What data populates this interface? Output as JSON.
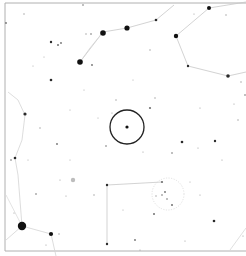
{
  "chart": {
    "type": "star-finder-chart",
    "width": 246,
    "height": 256,
    "background": "#ffffff",
    "frame": {
      "x": 5,
      "y": 3,
      "right": 250,
      "bottom": 251,
      "color": "#b0b0b0"
    },
    "target_circle": {
      "cx": 127,
      "cy": 127,
      "r": 17,
      "color": "#222222",
      "stroke_width": 1.3
    },
    "target_star": {
      "x": 127,
      "y": 127,
      "r": 1.6
    },
    "cluster": {
      "cx": 168,
      "cy": 194,
      "r": 16,
      "color": "#cfcfcf"
    },
    "galaxy": {
      "x": 73,
      "y": 180,
      "r": 2.2,
      "color": "#bdbdbd"
    },
    "constellation_lines": [
      {
        "points": [
          [
            80,
            62
          ],
          [
            103,
            32
          ],
          [
            127,
            28
          ],
          [
            156,
            20
          ],
          [
            174,
            5
          ]
        ],
        "color": "#c8c8c8"
      },
      {
        "points": [
          [
            103,
            32
          ],
          [
            90,
            48
          ],
          [
            80,
            62
          ]
        ],
        "color": "#d6d6d6"
      },
      {
        "points": [
          [
            176,
            36
          ],
          [
            209,
            8
          ],
          [
            246,
            2
          ]
        ],
        "color": "#c8c8c8"
      },
      {
        "points": [
          [
            176,
            36
          ],
          [
            188,
            66
          ],
          [
            228,
            76
          ],
          [
            246,
            72
          ]
        ],
        "color": "#c8c8c8"
      },
      {
        "points": [
          [
            22,
            226
          ],
          [
            18,
            175
          ],
          [
            15,
            158
          ],
          [
            22,
            140
          ],
          [
            25,
            115
          ],
          [
            18,
            100
          ],
          [
            8,
            92
          ]
        ],
        "color": "#d4d4d4"
      },
      {
        "points": [
          [
            22,
            226
          ],
          [
            51,
            234
          ],
          [
            56,
            256
          ]
        ],
        "color": "#d4d4d4"
      },
      {
        "points": [
          [
            22,
            226
          ],
          [
            6,
            240
          ]
        ],
        "color": "#d4d4d4"
      },
      {
        "points": [
          [
            22,
            226
          ],
          [
            6,
            195
          ]
        ],
        "color": "#dcdcdc"
      },
      {
        "points": [
          [
            107,
            244
          ],
          [
            107,
            185
          ],
          [
            162,
            182
          ]
        ],
        "color": "#c8c8c8"
      },
      {
        "points": [
          [
            246,
            228
          ],
          [
            230,
            250
          ]
        ],
        "color": "#d8d8d8"
      }
    ],
    "stars": [
      {
        "x": 22,
        "y": 226,
        "r": 4.2
      },
      {
        "x": 80,
        "y": 62,
        "r": 2.8
      },
      {
        "x": 103,
        "y": 33,
        "r": 2.8
      },
      {
        "x": 127,
        "y": 28,
        "r": 2.6
      },
      {
        "x": 176,
        "y": 36,
        "r": 2.2
      },
      {
        "x": 209,
        "y": 8,
        "r": 2.0
      },
      {
        "x": 228,
        "y": 76,
        "r": 1.8
      },
      {
        "x": 51,
        "y": 234,
        "r": 2.1
      },
      {
        "x": 25,
        "y": 114,
        "r": 1.6
      },
      {
        "x": 15,
        "y": 158,
        "r": 1.3
      },
      {
        "x": 51,
        "y": 80,
        "r": 1.3
      },
      {
        "x": 51,
        "y": 42,
        "r": 1.2
      },
      {
        "x": 58,
        "y": 45,
        "r": 1.0
      },
      {
        "x": 61,
        "y": 43,
        "r": 0.9
      },
      {
        "x": 156,
        "y": 20,
        "r": 1.3
      },
      {
        "x": 188,
        "y": 66,
        "r": 1.2
      },
      {
        "x": 107,
        "y": 185,
        "r": 1.2
      },
      {
        "x": 107,
        "y": 244,
        "r": 1.2
      },
      {
        "x": 162,
        "y": 182,
        "r": 1.1
      },
      {
        "x": 182,
        "y": 142,
        "r": 1.3
      },
      {
        "x": 215,
        "y": 141,
        "r": 1.2
      },
      {
        "x": 214,
        "y": 221,
        "r": 1.3
      },
      {
        "x": 150,
        "y": 108,
        "r": 1.1
      },
      {
        "x": 172,
        "y": 205,
        "r": 1.0
      },
      {
        "x": 154,
        "y": 214,
        "r": 1.0
      },
      {
        "x": 92,
        "y": 65,
        "r": 0.9
      },
      {
        "x": 57,
        "y": 144,
        "r": 0.9
      },
      {
        "x": 106,
        "y": 146,
        "r": 0.8
      },
      {
        "x": 172,
        "y": 153,
        "r": 0.8
      },
      {
        "x": 135,
        "y": 240,
        "r": 0.9
      },
      {
        "x": 165,
        "y": 192,
        "r": 0.9
      },
      {
        "x": 167,
        "y": 199,
        "r": 0.8
      },
      {
        "x": 162,
        "y": 195,
        "r": 0.8
      },
      {
        "x": 156,
        "y": 196,
        "r": 0.7
      },
      {
        "x": 6,
        "y": 23,
        "r": 0.9
      },
      {
        "x": 11,
        "y": 160,
        "r": 0.8
      },
      {
        "x": 59,
        "y": 234,
        "r": 0.7
      },
      {
        "x": 36,
        "y": 194,
        "r": 0.8
      },
      {
        "x": 83,
        "y": 5,
        "r": 0.8
      },
      {
        "x": 91,
        "y": 34,
        "r": 0.8
      },
      {
        "x": 86,
        "y": 34,
        "r": 0.7
      },
      {
        "x": 24,
        "y": 14,
        "r": 0.7
      },
      {
        "x": 40,
        "y": 128,
        "r": 0.7
      },
      {
        "x": 94,
        "y": 195,
        "r": 0.7
      },
      {
        "x": 155,
        "y": 98,
        "r": 0.7
      },
      {
        "x": 150,
        "y": 50,
        "r": 0.7
      },
      {
        "x": 226,
        "y": 15,
        "r": 0.7
      },
      {
        "x": 194,
        "y": 14,
        "r": 0.6
      },
      {
        "x": 245,
        "y": 95,
        "r": 0.8
      },
      {
        "x": 241,
        "y": 82,
        "r": 0.7
      },
      {
        "x": 238,
        "y": 120,
        "r": 0.7
      },
      {
        "x": 234,
        "y": 104,
        "r": 0.6
      },
      {
        "x": 200,
        "y": 108,
        "r": 0.6
      },
      {
        "x": 116,
        "y": 100,
        "r": 0.7
      },
      {
        "x": 112,
        "y": 113,
        "r": 0.6
      },
      {
        "x": 46,
        "y": 245,
        "r": 0.6
      },
      {
        "x": 14,
        "y": 213,
        "r": 0.6
      },
      {
        "x": 143,
        "y": 152,
        "r": 0.6
      },
      {
        "x": 198,
        "y": 148,
        "r": 0.6
      },
      {
        "x": 222,
        "y": 160,
        "r": 0.6
      },
      {
        "x": 185,
        "y": 241,
        "r": 0.6
      },
      {
        "x": 200,
        "y": 195,
        "r": 0.6
      },
      {
        "x": 60,
        "y": 180,
        "r": 0.6
      },
      {
        "x": 66,
        "y": 196,
        "r": 0.6
      },
      {
        "x": 28,
        "y": 160,
        "r": 0.5
      },
      {
        "x": 70,
        "y": 110,
        "r": 0.5
      },
      {
        "x": 44,
        "y": 57,
        "r": 0.5
      },
      {
        "x": 140,
        "y": 250,
        "r": 0.6
      },
      {
        "x": 190,
        "y": 182,
        "r": 0.5
      },
      {
        "x": 243,
        "y": 236,
        "r": 0.6
      },
      {
        "x": 33,
        "y": 66,
        "r": 0.5
      },
      {
        "x": 70,
        "y": 160,
        "r": 0.5
      },
      {
        "x": 84,
        "y": 90,
        "r": 0.5
      },
      {
        "x": 123,
        "y": 210,
        "r": 0.5
      },
      {
        "x": 98,
        "y": 118,
        "r": 0.5
      },
      {
        "x": 133,
        "y": 80,
        "r": 0.5
      }
    ]
  }
}
